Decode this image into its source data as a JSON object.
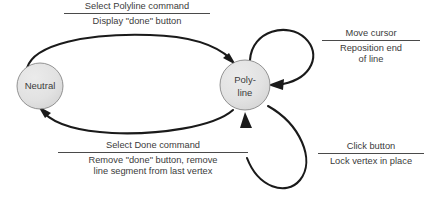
{
  "diagram": {
    "type": "state-transition-diagram",
    "background_color": "#ffffff",
    "node_fill_color": "#e2e2e2",
    "node_stroke_color": "#6e6e6e",
    "node_shadow_color": "#1a1a1a",
    "edge_color": "#1a1a1a",
    "text_color": "#3b3b3b"
  },
  "states": [
    {
      "id": "neutral",
      "label": "Neutral",
      "label_lines": [
        "Neutral"
      ],
      "cx": 40,
      "cy": 86,
      "r": 23
    },
    {
      "id": "polyline",
      "label": "Poly-line",
      "label_lines": [
        "Poly-",
        "line"
      ],
      "cx": 245,
      "cy": 85,
      "r": 25
    }
  ],
  "transitions": [
    {
      "id": "start-polyline",
      "from": "neutral",
      "to": "polyline",
      "trigger": "Select Polyline command",
      "action_lines": [
        "Display \"done\" button"
      ],
      "shape": "arc-above"
    },
    {
      "id": "finish-polyline",
      "from": "polyline",
      "to": "neutral",
      "trigger": "Select Done command",
      "action_lines": [
        "Remove \"done\" button, remove",
        "line segment from last vertex"
      ],
      "shape": "arc-below"
    },
    {
      "id": "move-cursor",
      "from": "polyline",
      "to": "polyline",
      "trigger": "Move cursor",
      "action_lines": [
        "Reposition end",
        "of line"
      ],
      "shape": "self-loop-upper"
    },
    {
      "id": "click-button",
      "from": "polyline",
      "to": "polyline",
      "trigger": "Click button",
      "action_lines": [
        "Lock vertex in place"
      ],
      "shape": "self-loop-lower"
    }
  ]
}
